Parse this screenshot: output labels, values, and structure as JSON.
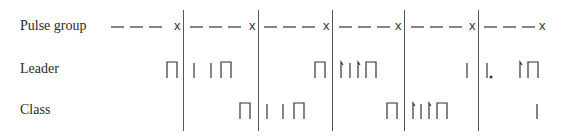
{
  "rows": [
    {
      "key": "pulse",
      "label": "Pulse group",
      "y": 27
    },
    {
      "key": "leader",
      "label": "Leader",
      "y": 70
    },
    {
      "key": "class",
      "label": "Class",
      "y": 111
    }
  ],
  "dividers_x": [
    183,
    258,
    332,
    404,
    478
  ],
  "colors": {
    "ink": "#333333",
    "divider": "#555555"
  },
  "pulse_groups": [
    {
      "dash_start": 111,
      "x_mark": 174
    },
    {
      "dash_start": 190,
      "x_mark": 249
    },
    {
      "dash_start": 264,
      "x_mark": 323
    },
    {
      "dash_start": 339,
      "x_mark": 395
    },
    {
      "dash_start": 411,
      "x_mark": 469
    },
    {
      "dash_start": 484,
      "x_mark": 539
    }
  ],
  "x_mark_glyph": "x",
  "leader_glyphs": [
    {
      "type": "bracket",
      "x": 167
    },
    {
      "type": "bar",
      "x": 194
    },
    {
      "type": "bar",
      "x": 211
    },
    {
      "type": "bracket",
      "x": 221
    },
    {
      "type": "bracket",
      "x": 315
    },
    {
      "type": "tickbar",
      "x": 341
    },
    {
      "type": "bar",
      "x": 350
    },
    {
      "type": "tickbar",
      "x": 358
    },
    {
      "type": "bracket",
      "x": 366
    },
    {
      "type": "bar",
      "x": 467
    },
    {
      "type": "bar-dot",
      "x": 487
    },
    {
      "type": "tickbar",
      "x": 520
    },
    {
      "type": "bracket",
      "x": 528
    }
  ],
  "class_glyphs": [
    {
      "type": "bracket",
      "x": 240
    },
    {
      "type": "bar",
      "x": 267
    },
    {
      "type": "bar",
      "x": 283
    },
    {
      "type": "bracket",
      "x": 294
    },
    {
      "type": "bracket",
      "x": 387
    },
    {
      "type": "tickbar",
      "x": 413
    },
    {
      "type": "bar",
      "x": 421
    },
    {
      "type": "tickbar",
      "x": 429
    },
    {
      "type": "bracket",
      "x": 437
    },
    {
      "type": "bar",
      "x": 537
    }
  ]
}
